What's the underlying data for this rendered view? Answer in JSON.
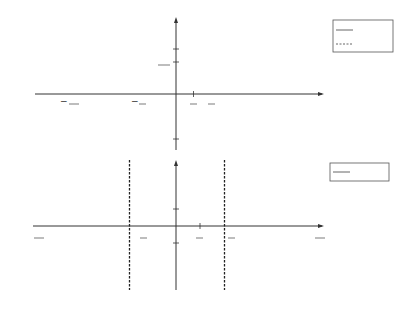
{
  "chart_data": [
    {
      "type": "line",
      "title": "",
      "xlabel": "x",
      "ylabel": "y",
      "xlim": [
        -6.2832,
        6.2832
      ],
      "ylim": [
        -1.2,
        1.2
      ],
      "grid": false,
      "legend_position": "right",
      "x_ticks": [
        "-2π",
        "-3π/2",
        "-π",
        "-π/2",
        "O",
        "π/4",
        "π/2",
        "π",
        "2π"
      ],
      "y_ticks": [
        "1",
        "√2/2",
        "-1"
      ],
      "series": [
        {
          "name": "cos x",
          "style": "solid",
          "function": "cos",
          "x_range": [
            -6.2832,
            6.2832
          ]
        },
        {
          "name": "sin x",
          "style": "dashed",
          "function": "sin",
          "x_range": [
            -6.2832,
            6.2832
          ]
        }
      ]
    },
    {
      "type": "line",
      "title": "",
      "xlabel": "x",
      "ylabel": "y",
      "xlim": [
        -4.7124,
        4.7124
      ],
      "ylim": [
        -3.8,
        3.8
      ],
      "grid": false,
      "legend_position": "right",
      "x_ticks": [
        "-3π/2",
        "-π",
        "-π/2",
        "O",
        "π/4",
        "π/2",
        "3π/2"
      ],
      "y_ticks": [
        "1",
        "-1"
      ],
      "asymptotes": [
        "-π/2",
        "π/2"
      ],
      "series": [
        {
          "name": "tan x",
          "style": "solid",
          "function": "tan",
          "x_range": [
            -4.7124,
            4.7124
          ]
        }
      ]
    }
  ],
  "top": {
    "axis_x": "x",
    "axis_y": "y",
    "origin": "O",
    "ticks": {
      "neg2pi": "−2π",
      "neg3pi2_num": "3π",
      "neg3pi2_den": "2",
      "negpi": "−π",
      "negpi2_num": "π",
      "negpi2_den": "2",
      "pi4_num": "π",
      "pi4_den": "4",
      "pi2_num": "π",
      "pi2_den": "2",
      "pi": "π",
      "twopi": "2π",
      "one": "1",
      "minus_one": "−1",
      "sqrt2_num": "√2",
      "sqrt2_den": "2"
    },
    "legend": [
      {
        "label_fn": "cos",
        "label_var": "x"
      },
      {
        "label_fn": "sin",
        "label_var": "x"
      }
    ]
  },
  "bottom": {
    "axis_x": "x",
    "axis_y": "y",
    "origin": "O",
    "ticks": {
      "neg3pi2_num": "3π",
      "neg3pi2_den": "2",
      "negpi": "− π",
      "negpi2_num": "π",
      "negpi2_den": "2",
      "pi4_num": "π",
      "pi4_den": "4",
      "pi2_num": "π",
      "pi2_den": "2",
      "pi32_num": "3π",
      "pi32_den": "2",
      "one": "1",
      "minus_one": "−1",
      "minus": "−"
    },
    "legend": [
      {
        "label_fn": "tan",
        "label_var": "x"
      }
    ]
  },
  "colors": {
    "curve": "#555555",
    "axis": "#333333",
    "text": "#222222"
  }
}
